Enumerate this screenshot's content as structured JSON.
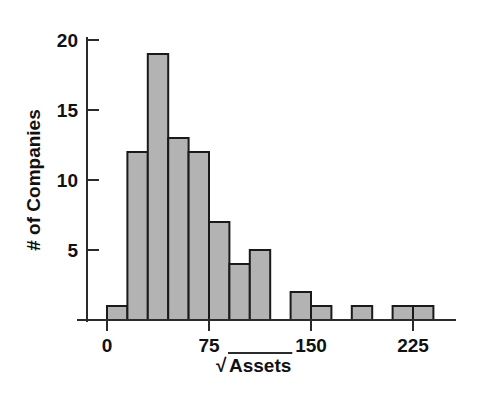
{
  "chart_data": {
    "type": "bar",
    "title": "",
    "subtitle": "",
    "xlabel": "√Assets",
    "ylabel": "# of Companies",
    "xlim": [
      -8,
      270
    ],
    "ylim": [
      0,
      21
    ],
    "grid": false,
    "legend": null,
    "bin_width": 15,
    "bar_fill_color": "#b3b3b3",
    "bar_edge_color": "#1a1a1a",
    "axis_color": "#2b2b2b",
    "x_ticks": [
      0,
      75,
      150,
      225
    ],
    "x_tick_labels": [
      "0",
      "75",
      "150",
      "225"
    ],
    "y_ticks": [
      5,
      10,
      15,
      20
    ],
    "y_tick_labels": [
      "5",
      "10",
      "15",
      "20"
    ],
    "bins": [
      {
        "start": 0,
        "end": 15,
        "count": 1
      },
      {
        "start": 15,
        "end": 30,
        "count": 12
      },
      {
        "start": 30,
        "end": 45,
        "count": 19
      },
      {
        "start": 45,
        "end": 60,
        "count": 13
      },
      {
        "start": 60,
        "end": 75,
        "count": 12
      },
      {
        "start": 75,
        "end": 90,
        "count": 7
      },
      {
        "start": 90,
        "end": 105,
        "count": 4
      },
      {
        "start": 105,
        "end": 120,
        "count": 5
      },
      {
        "start": 120,
        "end": 135,
        "count": 0
      },
      {
        "start": 135,
        "end": 150,
        "count": 2
      },
      {
        "start": 150,
        "end": 165,
        "count": 1
      },
      {
        "start": 165,
        "end": 180,
        "count": 0
      },
      {
        "start": 180,
        "end": 195,
        "count": 1
      },
      {
        "start": 195,
        "end": 210,
        "count": 0
      },
      {
        "start": 210,
        "end": 225,
        "count": 1
      },
      {
        "start": 225,
        "end": 240,
        "count": 1
      }
    ],
    "categories": [
      "0-15",
      "15-30",
      "30-45",
      "45-60",
      "60-75",
      "75-90",
      "90-105",
      "105-120",
      "120-135",
      "135-150",
      "150-165",
      "165-180",
      "180-195",
      "195-210",
      "210-225",
      "225-240"
    ],
    "values": [
      1,
      12,
      19,
      13,
      12,
      7,
      4,
      5,
      0,
      2,
      1,
      0,
      1,
      0,
      1,
      1
    ]
  },
  "axis": {
    "x_label_text": "Assets",
    "x_label_radical": "√",
    "y_label_text": "# of Companies"
  }
}
